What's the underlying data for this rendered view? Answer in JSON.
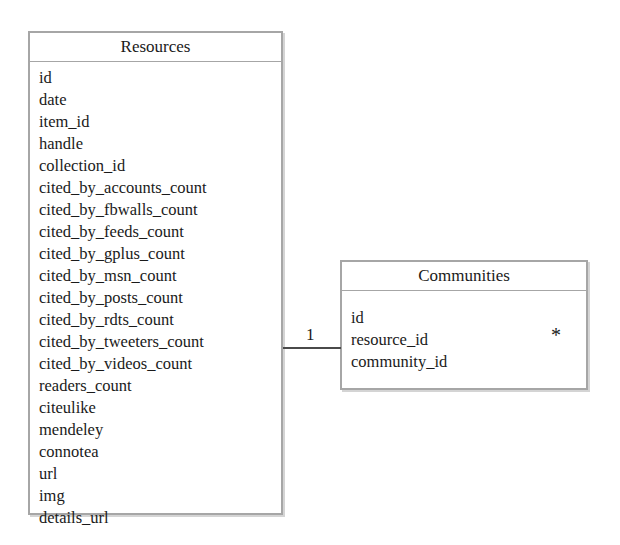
{
  "diagram": {
    "type": "entity-relationship-diagram",
    "background_color": "#ffffff",
    "border_color": "#a6a6a6",
    "text_color": "#1a1a1a",
    "line_color": "#4a4a4a"
  },
  "entities": [
    {
      "name": "Resources",
      "title": "Resources",
      "attributes": [
        "id",
        "date",
        "item_id",
        "handle",
        "collection_id",
        "cited_by_accounts_count",
        "cited_by_fbwalls_count",
        "cited_by_feeds_count",
        "cited_by_gplus_count",
        "cited_by_msn_count",
        "cited_by_posts_count",
        "cited_by_rdts_count",
        "cited_by_tweeters_count",
        "cited_by_videos_count",
        "readers_count",
        "citeulike",
        "mendeley",
        "connotea",
        "url",
        "img",
        "details_url"
      ]
    },
    {
      "name": "Communities",
      "title": "Communities",
      "attributes": [
        "id",
        "resource_id",
        "community_id"
      ]
    }
  ],
  "relationship": {
    "from_entity": "Resources",
    "to_entity": "Communities",
    "source_multiplicity": "1",
    "target_multiplicity": "*"
  }
}
